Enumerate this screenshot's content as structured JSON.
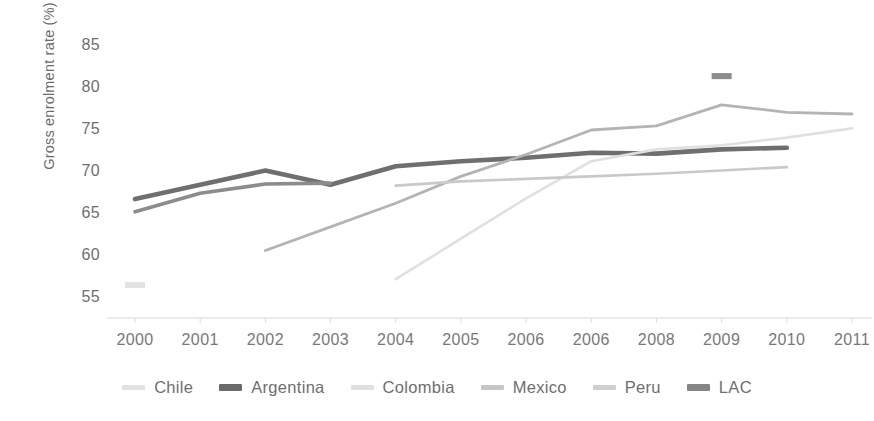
{
  "chart_data": {
    "type": "line",
    "title": "",
    "xlabel": "",
    "ylabel": "Gross enrolment rate (%)",
    "ylim": [
      53.5,
      86.5
    ],
    "yticks": [
      55,
      60,
      65,
      70,
      75,
      80,
      85
    ],
    "ytick_labels": [
      "55",
      "60",
      "65",
      "70",
      "75",
      "80",
      "85"
    ],
    "grid": false,
    "legend_position": "bottom",
    "categories": [
      "2000",
      "2001",
      "2002",
      "2003",
      "2004",
      "2005",
      "2006",
      "2006",
      "2008",
      "2009",
      "2010",
      "2011"
    ],
    "x": [
      2000,
      2001,
      2002,
      2003,
      2004,
      2005,
      2006,
      2007,
      2008,
      2009,
      2010,
      2011
    ],
    "series": [
      {
        "name": "Chile",
        "color": "#e2e2e2",
        "width": 3.2,
        "values": [
          56.7,
          null,
          null,
          null,
          null,
          null,
          null,
          null,
          null,
          null,
          null,
          null
        ]
      },
      {
        "name": "Argentina",
        "color": "#6f6f71",
        "width": 4.6,
        "values": [
          66.9,
          68.6,
          70.3,
          68.6,
          70.8,
          71.4,
          71.8,
          72.4,
          72.3,
          72.8,
          73.0,
          null
        ]
      },
      {
        "name": "Colombia",
        "color": "#e0e0e0",
        "width": 2.6,
        "values": [
          null,
          null,
          null,
          null,
          57.4,
          62.2,
          67.0,
          71.4,
          72.8,
          73.3,
          74.2,
          75.3
        ]
      },
      {
        "name": "Mexico",
        "color": "#b4b4b6",
        "width": 2.8,
        "values": [
          null,
          null,
          60.8,
          63.6,
          66.4,
          69.6,
          72.2,
          75.1,
          75.6,
          78.1,
          77.2,
          77.0
        ]
      },
      {
        "name": "Peru",
        "color": "#c9c9cb",
        "width": 2.6,
        "values": [
          null,
          null,
          null,
          null,
          68.5,
          69.0,
          69.3,
          69.6,
          69.9,
          70.3,
          70.7,
          null
        ]
      },
      {
        "name": "LAC",
        "color": "#8c8c8e",
        "width": 3.6,
        "values": [
          65.4,
          67.6,
          68.7,
          68.8,
          null,
          null,
          null,
          null,
          null,
          81.5,
          null,
          null
        ]
      }
    ],
    "annotations": [
      {
        "series": "LAC",
        "x": 2009,
        "y": 81.5,
        "note": "isolated marker segment"
      }
    ]
  },
  "legend": {
    "items": [
      {
        "label": "Chile",
        "color": "#e2e2e2",
        "thickness": 5
      },
      {
        "label": "Argentina",
        "color": "#6a6a6c",
        "thickness": 7
      },
      {
        "label": "Colombia",
        "color": "#e0e0e0",
        "thickness": 5
      },
      {
        "label": "Mexico",
        "color": "#c6c6c8",
        "thickness": 5
      },
      {
        "label": "Peru",
        "color": "#cfcfd1",
        "thickness": 5
      },
      {
        "label": "LAC",
        "color": "#858587",
        "thickness": 7
      }
    ]
  },
  "colors": {
    "background": "#ffffff",
    "axis": "#d8d8d8",
    "tick_text": "#6e6e70",
    "axis_title": "#6b6b6d"
  }
}
